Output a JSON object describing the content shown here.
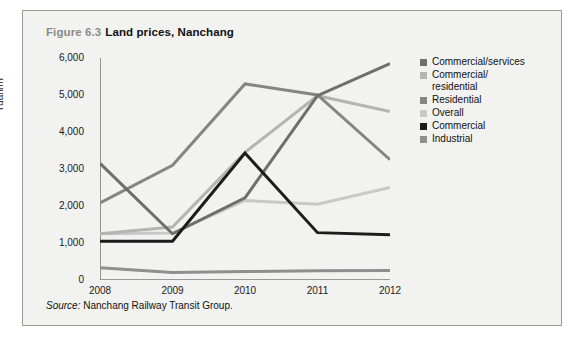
{
  "figure": {
    "number": "Figure 6.3",
    "name": "Land prices, Nanchang",
    "source_word": "Source:",
    "source_text": "Nanchang Railway Transit Group."
  },
  "chart_data": {
    "type": "line",
    "title": "Land prices, Nanchang",
    "xlabel": "",
    "ylabel": "Yuan/m²",
    "categories": [
      "2008",
      "2009",
      "2010",
      "2011",
      "2012"
    ],
    "x_tick_labels": [
      "2008",
      "2009",
      "2010",
      "2011",
      "2012"
    ],
    "y_tick_labels": [
      "0",
      "1,000",
      "2,000",
      "3,000",
      "4,000",
      "5,000",
      "6,000"
    ],
    "y_ticks": [
      0,
      1000,
      2000,
      3000,
      4000,
      5000,
      6000
    ],
    "ylim": [
      0,
      6000
    ],
    "grid": false,
    "legend_position": "right",
    "series": [
      {
        "name": "Commercial/services",
        "label": "Commercial/services",
        "color": "#6e6e6e",
        "values": [
          3150,
          1250,
          2220,
          4980,
          5850
        ]
      },
      {
        "name": "Commercial/residential",
        "label": "Commercial/\nresidential",
        "color": "#b4b4b4",
        "values": [
          1250,
          1430,
          3450,
          4980,
          4550
        ]
      },
      {
        "name": "Residential",
        "label": "Residential",
        "color": "#858585",
        "values": [
          2080,
          3100,
          5300,
          5000,
          3250
        ]
      },
      {
        "name": "Overall",
        "label": "Overall",
        "color": "#c8c8c8",
        "values": [
          1250,
          1270,
          2150,
          2050,
          2500
        ]
      },
      {
        "name": "Commercial",
        "label": "Commercial",
        "color": "#1c1c1c",
        "values": [
          1050,
          1050,
          3430,
          1280,
          1220
        ]
      },
      {
        "name": "Industrial",
        "label": "Industrial",
        "color": "#8f8f8f",
        "values": [
          330,
          200,
          230,
          250,
          260
        ]
      }
    ]
  }
}
